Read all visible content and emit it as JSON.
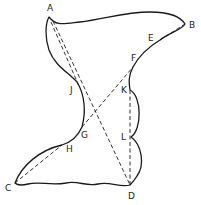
{
  "diagram": {
    "type": "geometric-figure",
    "colors": {
      "stroke": "#1a1a1a",
      "label": "#222222",
      "background": "#ffffff"
    },
    "points": [
      {
        "id": "A",
        "label": "A",
        "x": 49,
        "y": 17,
        "lx": 47,
        "ly": 11
      },
      {
        "id": "B",
        "label": "B",
        "x": 185,
        "y": 24,
        "lx": 189,
        "ly": 28
      },
      {
        "id": "E",
        "label": "E",
        "x": 160,
        "y": 40,
        "lx": 148,
        "ly": 41
      },
      {
        "id": "F",
        "label": "F",
        "x": 133,
        "y": 67,
        "lx": 131,
        "ly": 61
      },
      {
        "id": "K",
        "label": "K",
        "x": 130,
        "y": 90,
        "lx": 121,
        "ly": 93
      },
      {
        "id": "L",
        "label": "L",
        "x": 131,
        "y": 137,
        "lx": 121,
        "ly": 140
      },
      {
        "id": "D",
        "label": "D",
        "x": 130,
        "y": 185,
        "lx": 128,
        "ly": 199
      },
      {
        "id": "C",
        "label": "C",
        "x": 15,
        "y": 183,
        "lx": 5,
        "ly": 191
      },
      {
        "id": "H",
        "label": "H",
        "x": 62,
        "y": 145,
        "lx": 66,
        "ly": 152
      },
      {
        "id": "G",
        "label": "G",
        "x": 82,
        "y": 127,
        "lx": 81,
        "ly": 138
      },
      {
        "id": "J",
        "label": "J",
        "x": 77,
        "y": 82,
        "lx": 70,
        "ly": 93
      }
    ],
    "dashed_segments": [
      {
        "from": "A",
        "to": "J"
      },
      {
        "from": "A",
        "to": "D"
      },
      {
        "from": "G",
        "to": "F"
      },
      {
        "from": "C",
        "to": "H"
      },
      {
        "from": "E",
        "to": "B"
      },
      {
        "from": "K",
        "to": "D"
      }
    ],
    "labels": {
      "A": "A",
      "B": "B",
      "C": "C",
      "D": "D",
      "E": "E",
      "F": "F",
      "G": "G",
      "H": "H",
      "J": "J",
      "K": "K",
      "L": "L"
    }
  }
}
